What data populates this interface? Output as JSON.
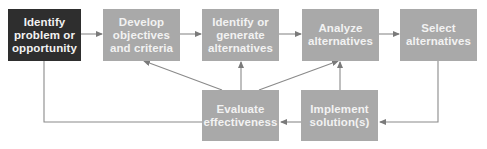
{
  "diagram": {
    "colors": {
      "primary_box": "#2e2e2e",
      "step_box": "#a9a9a9",
      "arrow": "#8a8a8a",
      "text": "#f2f2f2"
    },
    "nodes": [
      {
        "id": "identify-problem",
        "label": "Identify\nproblem or\nopportunity",
        "style": "primary"
      },
      {
        "id": "develop-objectives",
        "label": "Develop\nobjectives\nand criteria",
        "style": "step"
      },
      {
        "id": "identify-alternatives",
        "label": "Identify or\ngenerate\nalternatives",
        "style": "step"
      },
      {
        "id": "analyze-alternatives",
        "label": "Analyze\nalternatives",
        "style": "step"
      },
      {
        "id": "select-alternatives",
        "label": "Select\nalternatives",
        "style": "step"
      },
      {
        "id": "evaluate-effectiveness",
        "label": "Evaluate\neffectiveness",
        "style": "step"
      },
      {
        "id": "implement-solutions",
        "label": "Implement\nsolution(s)",
        "style": "step"
      }
    ],
    "edges": [
      {
        "from": "identify-problem",
        "to": "develop-objectives"
      },
      {
        "from": "develop-objectives",
        "to": "identify-alternatives"
      },
      {
        "from": "identify-alternatives",
        "to": "analyze-alternatives"
      },
      {
        "from": "analyze-alternatives",
        "to": "select-alternatives"
      },
      {
        "from": "select-alternatives",
        "to": "implement-solutions"
      },
      {
        "from": "implement-solutions",
        "to": "evaluate-effectiveness"
      },
      {
        "from": "implement-solutions",
        "to": "analyze-alternatives"
      },
      {
        "from": "evaluate-effectiveness",
        "to": "develop-objectives"
      },
      {
        "from": "evaluate-effectiveness",
        "to": "identify-alternatives"
      },
      {
        "from": "evaluate-effectiveness",
        "to": "analyze-alternatives"
      },
      {
        "from": "evaluate-effectiveness",
        "to": "identify-problem"
      }
    ]
  }
}
